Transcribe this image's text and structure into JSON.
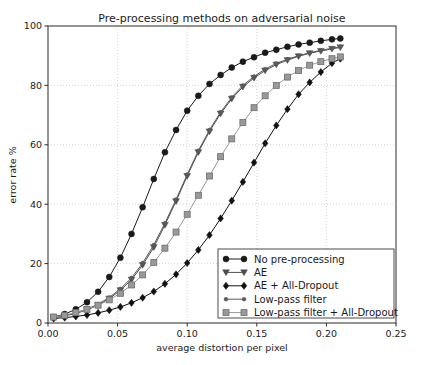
{
  "chart_data": {
    "type": "line",
    "title": "Pre-processing methods on adversarial noise",
    "xlabel": "average distortion per pixel",
    "ylabel": "error rate %",
    "xlim": [
      0.0,
      0.25
    ],
    "ylim": [
      0,
      100
    ],
    "xticks": [
      "0.00",
      "0.05",
      "0.10",
      "0.15",
      "0.20",
      "0.25"
    ],
    "xtick_values": [
      0.0,
      0.05,
      0.1,
      0.15,
      0.2,
      0.25
    ],
    "yticks": [
      "0",
      "20",
      "40",
      "60",
      "80",
      "100"
    ],
    "ytick_values": [
      0,
      20,
      40,
      60,
      80,
      100
    ],
    "grid": true,
    "grid_style": "dotted",
    "grid_color": "#c8c8c8",
    "legend_position": "lower right",
    "series": [
      {
        "name": "No pre-processing",
        "marker": "circle",
        "color": "#1a1a1a",
        "x": [
          0.004,
          0.012,
          0.02,
          0.028,
          0.036,
          0.044,
          0.052,
          0.06,
          0.068,
          0.076,
          0.084,
          0.092,
          0.1,
          0.108,
          0.116,
          0.124,
          0.132,
          0.14,
          0.148,
          0.156,
          0.164,
          0.172,
          0.18,
          0.188,
          0.196,
          0.204,
          0.21
        ],
        "y": [
          2.0,
          3.0,
          4.6,
          7.0,
          10.5,
          15.5,
          22.0,
          30.0,
          39.0,
          48.5,
          57.5,
          65.0,
          71.5,
          76.5,
          80.5,
          83.5,
          86.0,
          88.0,
          89.5,
          91.0,
          92.0,
          93.0,
          93.8,
          94.4,
          95.0,
          95.5,
          95.8
        ]
      },
      {
        "name": "AE",
        "marker": "triangle-down",
        "color": "#4d4d4d",
        "x": [
          0.004,
          0.012,
          0.02,
          0.028,
          0.036,
          0.044,
          0.052,
          0.06,
          0.068,
          0.076,
          0.084,
          0.092,
          0.1,
          0.108,
          0.116,
          0.124,
          0.132,
          0.14,
          0.148,
          0.156,
          0.164,
          0.172,
          0.18,
          0.188,
          0.196,
          0.204,
          0.21
        ],
        "y": [
          1.8,
          2.4,
          3.2,
          4.4,
          6.0,
          8.2,
          11.0,
          14.6,
          19.5,
          25.5,
          33.0,
          41.0,
          49.5,
          57.5,
          64.5,
          70.5,
          75.5,
          79.5,
          82.5,
          85.0,
          87.0,
          88.5,
          89.8,
          90.8,
          91.6,
          92.3,
          92.8
        ]
      },
      {
        "name": "AE + All-Dropout",
        "marker": "diamond",
        "color": "#111111",
        "x": [
          0.004,
          0.012,
          0.02,
          0.028,
          0.036,
          0.044,
          0.052,
          0.06,
          0.068,
          0.076,
          0.084,
          0.092,
          0.1,
          0.108,
          0.116,
          0.124,
          0.132,
          0.14,
          0.148,
          0.156,
          0.164,
          0.172,
          0.18,
          0.188,
          0.196,
          0.204,
          0.21
        ],
        "y": [
          1.5,
          1.8,
          2.2,
          2.7,
          3.4,
          4.3,
          5.4,
          6.8,
          8.5,
          10.6,
          13.2,
          16.4,
          20.2,
          24.6,
          29.6,
          35.2,
          41.2,
          47.5,
          54.0,
          60.5,
          66.5,
          72.0,
          77.0,
          81.0,
          84.5,
          87.5,
          89.0
        ]
      },
      {
        "name": "Low-pass filter",
        "marker": "dot",
        "color": "#5a5a5a",
        "x": [
          0.004,
          0.012,
          0.02,
          0.028,
          0.036,
          0.044,
          0.052,
          0.06,
          0.068,
          0.076,
          0.084,
          0.092,
          0.1,
          0.108,
          0.116,
          0.124,
          0.132,
          0.14,
          0.148,
          0.156,
          0.164,
          0.172,
          0.18,
          0.188,
          0.196,
          0.204,
          0.21
        ],
        "y": [
          1.9,
          2.5,
          3.4,
          4.7,
          6.3,
          8.6,
          11.5,
          15.2,
          20.2,
          26.3,
          33.6,
          41.6,
          50.0,
          58.0,
          65.0,
          71.0,
          76.0,
          80.0,
          83.0,
          85.5,
          87.4,
          88.8,
          90.0,
          91.0,
          91.8,
          92.5,
          93.0
        ]
      },
      {
        "name": "Low-pass filter + All-Dropout",
        "marker": "square",
        "color": "#999999",
        "x": [
          0.004,
          0.012,
          0.02,
          0.028,
          0.036,
          0.044,
          0.052,
          0.06,
          0.068,
          0.076,
          0.084,
          0.092,
          0.1,
          0.108,
          0.116,
          0.124,
          0.132,
          0.14,
          0.148,
          0.156,
          0.164,
          0.172,
          0.18,
          0.188,
          0.196,
          0.204,
          0.21
        ],
        "y": [
          2.0,
          2.6,
          3.5,
          4.6,
          6.0,
          7.8,
          10.0,
          12.8,
          16.2,
          20.4,
          25.2,
          30.6,
          36.6,
          43.0,
          49.5,
          56.0,
          62.0,
          67.5,
          72.5,
          76.5,
          80.0,
          82.8,
          85.0,
          86.8,
          88.0,
          89.0,
          89.6
        ]
      }
    ]
  },
  "legend": {
    "entries": [
      "No pre-processing",
      "AE",
      "AE + All-Dropout",
      "Low-pass filter",
      "Low-pass filter + All-Dropout"
    ]
  }
}
